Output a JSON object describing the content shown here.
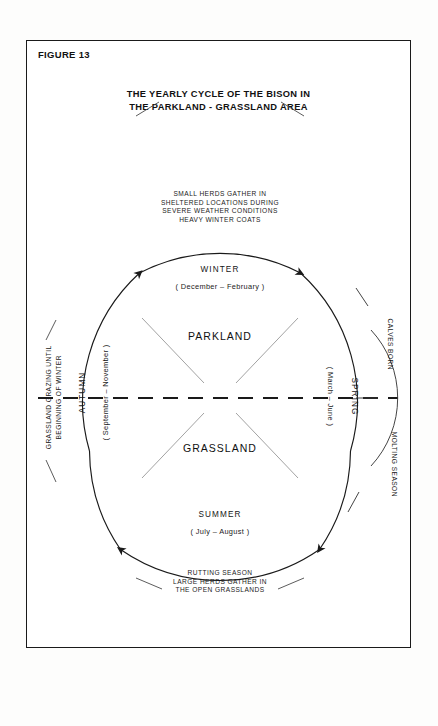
{
  "figure": {
    "label": "FIGURE 13",
    "title_line1": "THE YEARLY CYCLE OF THE BISON IN",
    "title_line2": "THE PARKLAND - GRASSLAND AREA"
  },
  "diagram": {
    "type": "cycle",
    "direction": "clockwise",
    "zones": {
      "upper": "PARKLAND",
      "lower": "GRASSLAND"
    },
    "seasons": [
      {
        "name": "WINTER",
        "months": "( December – February )",
        "position": "top"
      },
      {
        "name": "SPRING",
        "months": "( March – June )",
        "position": "right"
      },
      {
        "name": "SUMMER",
        "months": "( July – August )",
        "position": "bottom"
      },
      {
        "name": "AUTUMN",
        "months": "( September – November )",
        "position": "left"
      }
    ],
    "annotations": {
      "top": [
        "SMALL HERDS GATHER IN",
        "SHELTERED LOCATIONS DURING",
        "SEVERE WEATHER CONDITIONS",
        "HEAVY WINTER COATS"
      ],
      "bottom": [
        "RUTTING SEASON",
        "LARGE HERDS GATHER IN",
        "THE OPEN GRASSLANDS"
      ],
      "left": [
        "GRASSLAND GRAZING UNTIL",
        "BEGINNING OF WINTER"
      ],
      "right_upper": "CALVES BORN",
      "right_lower": "MOLTING SEASON"
    },
    "colors": {
      "ink": "#1a1a1a",
      "light_rule": "#9a9a9a",
      "paper": "#ffffff"
    }
  }
}
